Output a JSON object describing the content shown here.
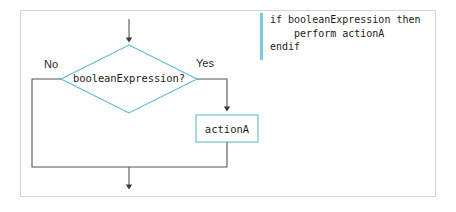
{
  "figure": {
    "type": "flowchart",
    "decision": {
      "label": "booleanExpression?",
      "shape": "diamond",
      "outline_color": "#5bbcd0",
      "fill_color": "#ffffff"
    },
    "process": {
      "label": "actionA",
      "shape": "rectangle",
      "outline_color": "#5bbcd0",
      "fill_color": "#ffffff"
    },
    "branches": [
      {
        "name": "no-branch",
        "label": "No",
        "direction": "left"
      },
      {
        "name": "yes-branch",
        "label": "Yes",
        "direction": "right"
      }
    ],
    "connector_color": "#555555",
    "frame_color": "#d6d6d6"
  },
  "pseudocode": {
    "accent_color": "#7ec8de",
    "lines": [
      "if booleanExpression then",
      "    perform actionA",
      "endif"
    ],
    "text": "if booleanExpression then\n    perform actionA\nendif"
  }
}
